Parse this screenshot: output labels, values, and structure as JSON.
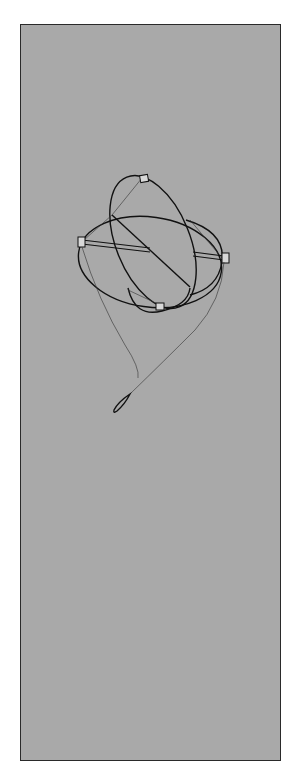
{
  "figure": {
    "background_color": "#a9a9a9",
    "border_color": "#2a2a2a",
    "ink_color": "#111111"
  }
}
